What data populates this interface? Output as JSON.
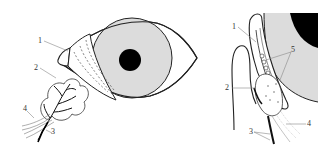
{
  "diagram": {
    "left_panel": {
      "view": "frontal",
      "labels": [
        {
          "id": "1",
          "text": "1"
        },
        {
          "id": "2",
          "text": "2"
        },
        {
          "id": "3",
          "text": "3"
        },
        {
          "id": "4",
          "text": "4"
        }
      ]
    },
    "right_panel": {
      "view": "sagittal",
      "labels": [
        {
          "id": "1",
          "text": "1"
        },
        {
          "id": "2",
          "text": "2"
        },
        {
          "id": "3",
          "text": "3"
        },
        {
          "id": "4",
          "text": "4"
        },
        {
          "id": "5",
          "text": "5"
        }
      ]
    },
    "colors": {
      "stroke": "#222222",
      "globe_fill": "#dcdcdc",
      "pupil_fill": "#000000",
      "leader_line": "#888888",
      "background": "#ffffff"
    }
  }
}
